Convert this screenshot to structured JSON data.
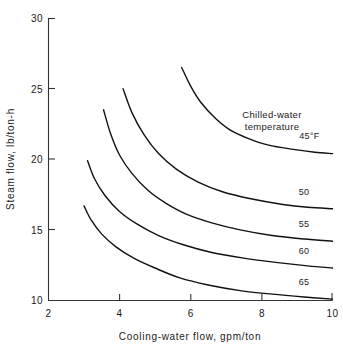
{
  "chart_data": {
    "type": "line",
    "title": "",
    "xlabel": "Cooling-water flow, gpm/ton",
    "ylabel": "Steam flow, lb/ton-h",
    "xlim": [
      2,
      10
    ],
    "ylim": [
      10,
      30
    ],
    "xticks": [
      2,
      4,
      6,
      8,
      10
    ],
    "xtick_labels": [
      "2",
      "4",
      "6",
      "8",
      "10"
    ],
    "yticks": [
      10,
      15,
      20,
      25,
      30
    ],
    "ytick_labels": [
      "10",
      "15",
      "20",
      "25",
      "30"
    ],
    "grid": false,
    "legend_position": "inline-right-of-curves",
    "annotations": [
      {
        "text_line1": "Chilled-water",
        "text_line2": "temperature",
        "x": 7.55,
        "y": 23.6
      }
    ],
    "series": [
      {
        "name": "45°F",
        "label": "45°F",
        "points": [
          [
            5.75,
            26.5
          ],
          [
            6.0,
            25.2
          ],
          [
            6.3,
            24.0
          ],
          [
            6.7,
            22.9
          ],
          [
            7.1,
            22.1
          ],
          [
            7.6,
            21.5
          ],
          [
            8.2,
            21.0
          ],
          [
            8.9,
            20.7
          ],
          [
            9.5,
            20.5
          ],
          [
            10.0,
            20.4
          ]
        ]
      },
      {
        "name": "50",
        "label": "50",
        "points": [
          [
            4.1,
            25.0
          ],
          [
            4.35,
            23.3
          ],
          [
            4.7,
            21.7
          ],
          [
            5.1,
            20.4
          ],
          [
            5.6,
            19.3
          ],
          [
            6.2,
            18.4
          ],
          [
            6.9,
            17.7
          ],
          [
            7.7,
            17.2
          ],
          [
            8.6,
            16.8
          ],
          [
            9.3,
            16.6
          ],
          [
            10.0,
            16.5
          ]
        ]
      },
      {
        "name": "55",
        "label": "55",
        "points": [
          [
            3.55,
            23.5
          ],
          [
            3.75,
            21.8
          ],
          [
            4.0,
            20.3
          ],
          [
            4.35,
            19.0
          ],
          [
            4.8,
            17.8
          ],
          [
            5.3,
            16.9
          ],
          [
            5.9,
            16.1
          ],
          [
            6.6,
            15.5
          ],
          [
            7.4,
            15.0
          ],
          [
            8.3,
            14.6
          ],
          [
            9.2,
            14.35
          ],
          [
            10.0,
            14.2
          ]
        ]
      },
      {
        "name": "60",
        "label": "60",
        "points": [
          [
            3.1,
            19.9
          ],
          [
            3.3,
            18.6
          ],
          [
            3.6,
            17.4
          ],
          [
            4.0,
            16.3
          ],
          [
            4.5,
            15.4
          ],
          [
            5.1,
            14.6
          ],
          [
            5.8,
            13.95
          ],
          [
            6.6,
            13.4
          ],
          [
            7.5,
            13.0
          ],
          [
            8.4,
            12.7
          ],
          [
            9.3,
            12.45
          ],
          [
            10.0,
            12.3
          ]
        ]
      },
      {
        "name": "65",
        "label": "65",
        "points": [
          [
            3.0,
            16.7
          ],
          [
            3.2,
            15.7
          ],
          [
            3.5,
            14.7
          ],
          [
            3.9,
            13.8
          ],
          [
            4.4,
            13.0
          ],
          [
            5.0,
            12.3
          ],
          [
            5.7,
            11.6
          ],
          [
            6.5,
            11.1
          ],
          [
            7.4,
            10.7
          ],
          [
            8.3,
            10.45
          ],
          [
            9.2,
            10.25
          ],
          [
            10.0,
            10.1
          ]
        ]
      }
    ],
    "series_label_positions": [
      {
        "name": "45°F",
        "x": 9.35,
        "y": 21.45
      },
      {
        "name": "50",
        "x": 9.2,
        "y": 17.5
      },
      {
        "name": "55",
        "x": 9.2,
        "y": 15.2
      },
      {
        "name": "60",
        "x": 9.2,
        "y": 13.3
      },
      {
        "name": "65",
        "x": 9.2,
        "y": 11.1
      }
    ],
    "colors": {
      "curve": "#111111",
      "axis": "#333333",
      "text": "#1a1a1a",
      "background": "#ffffff"
    }
  }
}
